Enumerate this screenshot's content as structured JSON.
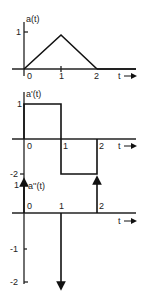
{
  "graphs": [
    {
      "id": "a",
      "ylabel": "a(t)",
      "xticks": [
        "0",
        "1",
        "2"
      ],
      "yticks": [
        "1"
      ],
      "xlabel": "t",
      "description": "triangle pulse rising from 0 at t=0 to 1 at t=1, back to 0 at t=2"
    },
    {
      "id": "a_prime",
      "ylabel": "a'(t)",
      "xticks": [
        "0",
        "1",
        "2"
      ],
      "yticks": [
        "1",
        "-2"
      ],
      "xlabel": "t",
      "description": "value 1 on (0,1), value -1 on (1,2), 0 elsewhere"
    },
    {
      "id": "a_double_prime",
      "ylabel": "a''(t)",
      "xticks": [
        "0",
        "1",
        "2"
      ],
      "yticks": [
        "1",
        "-1",
        "-2"
      ],
      "xlabel": "t",
      "description": "impulse +1 at t=0, impulse -2 at t=1, impulse +1 at t=2"
    }
  ]
}
